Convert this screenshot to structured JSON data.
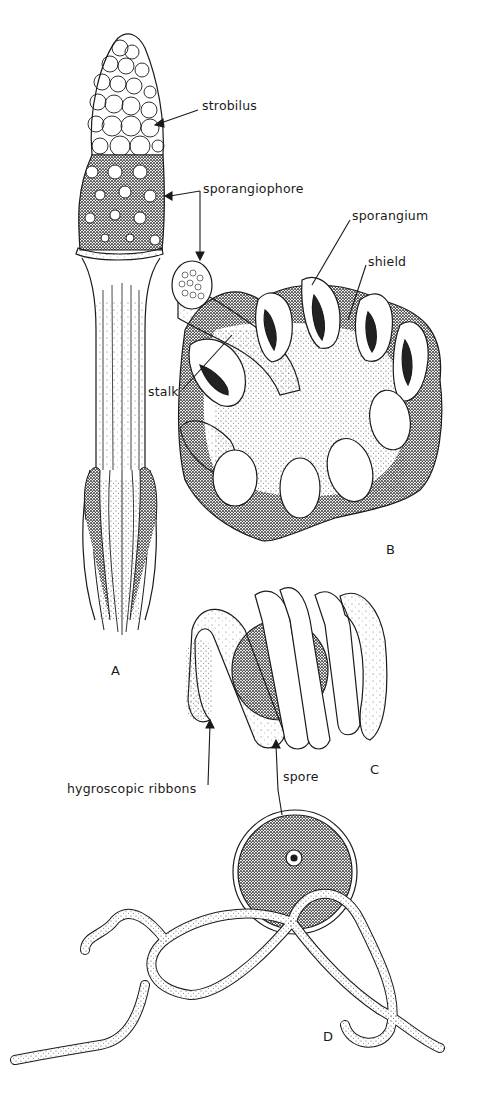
{
  "figure": {
    "panels": [
      {
        "id": "A",
        "label": "A",
        "subject": "horsetail strobilus on stem"
      },
      {
        "id": "B",
        "label": "B",
        "subject": "sporangiophore detail"
      },
      {
        "id": "C",
        "label": "C",
        "subject": "spore with coiled hygroscopic ribbons"
      },
      {
        "id": "D",
        "label": "D",
        "subject": "spore with uncoiled hygroscopic ribbons"
      }
    ],
    "labels": {
      "strobilus": "strobilus",
      "sporangiophore": "sporangiophore",
      "sporangium": "sporangium",
      "shield": "shield",
      "stalk": "stalk",
      "hygroscopic_ribbons": "hygroscopic ribbons",
      "spore": "spore"
    },
    "colors": {
      "ink": "#1a1a1a",
      "paper": "#ffffff",
      "stipple": "#555555"
    }
  }
}
